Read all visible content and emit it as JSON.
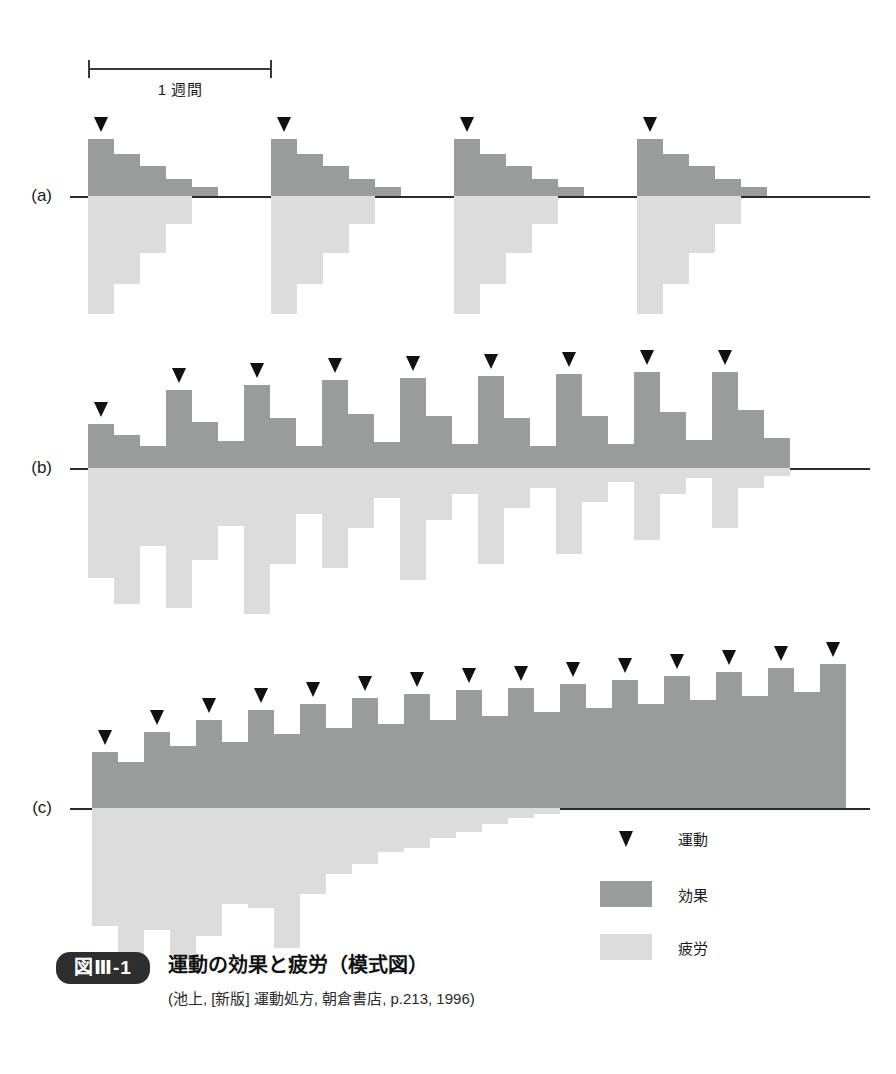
{
  "figure": {
    "badge": "図Ⅲ-1",
    "title": "運動の効果と疲労（模式図）",
    "source": "(池上, [新版] 運動処方, 朝倉書店, p.213, 1996)"
  },
  "scale": {
    "label": "1 週間",
    "x": 88,
    "y": 56,
    "width": 184
  },
  "colors": {
    "effect": "#9a9b9b",
    "fatigue": "#dcdcdc",
    "axis": "#2b2b2b",
    "arrow": "#111111",
    "badge_bg": "#2e2e2e",
    "text": "#1a1a1a"
  },
  "legend": {
    "x": 600,
    "y": 828,
    "items": [
      {
        "mark": "arrow-marker",
        "label": "運動"
      },
      {
        "mark": "effect-swatch",
        "label": "効果"
      },
      {
        "mark": "fatigue-swatch",
        "label": "疲労"
      }
    ]
  },
  "panels": [
    {
      "id": "a",
      "label": "(a)",
      "label_x": 52,
      "baseline_y": 196,
      "axis_x": 70,
      "axis_width": 800,
      "bar_width": 26,
      "origin_x": 88,
      "slot_period": 7,
      "bouts": 4,
      "bout_step": 183,
      "effect_heights": [
        57,
        42,
        30,
        17,
        9
      ],
      "fatigue_depths": [
        118,
        88,
        57,
        28,
        0
      ],
      "arrow_on": 0
    },
    {
      "id": "b",
      "label": "(b)",
      "label_x": 52,
      "baseline_y": 468,
      "axis_x": 70,
      "axis_width": 800,
      "bar_width": 26,
      "origin_x": 88,
      "bar_count": 28,
      "arrow_every": 3,
      "effect_heights": [
        44,
        33,
        22,
        78,
        46,
        27,
        83,
        50,
        22,
        88,
        54,
        26,
        90,
        52,
        24,
        92,
        50,
        22,
        94,
        52,
        24,
        96,
        56,
        28,
        96,
        58,
        30
      ],
      "fatigue_depths": [
        110,
        136,
        78,
        140,
        92,
        58,
        146,
        96,
        46,
        100,
        60,
        30,
        112,
        52,
        26,
        96,
        40,
        20,
        86,
        34,
        14,
        72,
        26,
        10,
        60,
        20,
        8
      ],
      "arrow_indices": [
        0,
        3,
        6,
        9,
        12,
        15,
        18,
        21,
        24
      ]
    },
    {
      "id": "c",
      "label": "(c)",
      "label_x": 52,
      "baseline_y": 808,
      "axis_x": 70,
      "axis_width": 800,
      "bar_width": 26,
      "origin_x": 92,
      "bar_count": 29,
      "arrow_every": 2,
      "effect_heights": [
        56,
        46,
        76,
        62,
        88,
        66,
        98,
        74,
        104,
        80,
        110,
        84,
        114,
        88,
        118,
        92,
        120,
        96,
        124,
        100,
        128,
        104,
        132,
        108,
        136,
        112,
        140,
        116,
        144
      ],
      "fatigue_depths": [
        118,
        146,
        122,
        150,
        128,
        96,
        100,
        140,
        86,
        66,
        56,
        44,
        40,
        30,
        24,
        16,
        10,
        6,
        0,
        0,
        0,
        0,
        0,
        0,
        0,
        0,
        0,
        0,
        0
      ],
      "arrow_indices": [
        0,
        2,
        4,
        6,
        8,
        10,
        12,
        14,
        16,
        18,
        20,
        22,
        24,
        26,
        28
      ]
    }
  ]
}
